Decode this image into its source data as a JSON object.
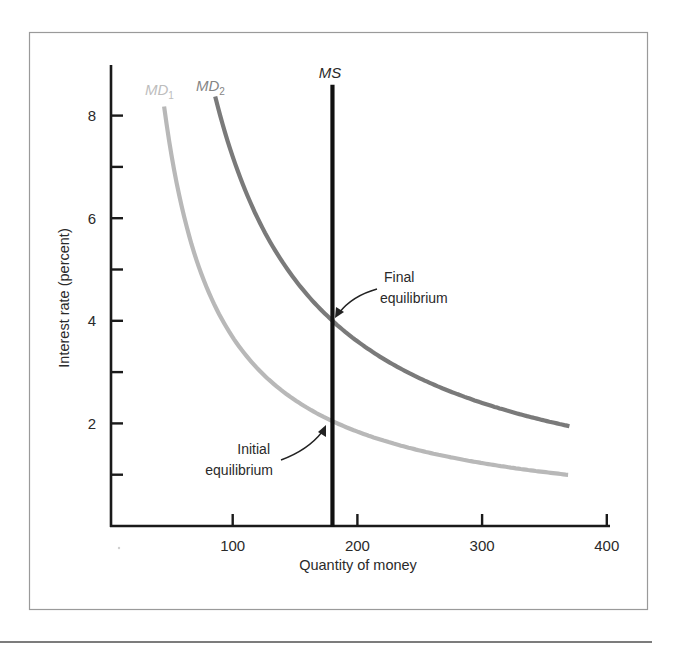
{
  "chart_data": {
    "type": "line",
    "title": "",
    "xlabel": "Quantity of money",
    "ylabel": "Interest rate (percent)",
    "xlim": [
      0,
      400
    ],
    "ylim": [
      0,
      9
    ],
    "x_ticks": [
      100,
      200,
      300,
      400
    ],
    "x_tick_labels": [
      "100",
      "200",
      "300",
      "400"
    ],
    "y_ticks": [
      1,
      2,
      3,
      4,
      5,
      6,
      7,
      8
    ],
    "y_tick_labels": [
      "",
      "2",
      "",
      "4",
      "",
      "6",
      "",
      "8"
    ],
    "grid": false,
    "legend": "inline labels at top of curves",
    "series": [
      {
        "name": "MD1",
        "label_main": "MD",
        "label_sub": "1",
        "color": "#b8b8b8",
        "kind": "money demand curve (r = k/Q)",
        "k": 368,
        "x": [
          45,
          60,
          80,
          100,
          130,
          160,
          180,
          220,
          260,
          300,
          340,
          370
        ],
        "values": [
          8.2,
          6.13,
          4.6,
          3.68,
          2.83,
          2.3,
          2.04,
          1.67,
          1.42,
          1.23,
          1.08,
          0.99
        ]
      },
      {
        "name": "MD2",
        "label_main": "MD",
        "label_sub": "2",
        "color": "#7a7a7a",
        "kind": "money demand curve (r = k/Q)",
        "k": 720,
        "x": [
          86,
          100,
          120,
          150,
          180,
          220,
          260,
          300,
          340,
          370
        ],
        "values": [
          8.37,
          7.2,
          6.0,
          4.8,
          4.0,
          3.27,
          2.77,
          2.4,
          2.12,
          1.95
        ]
      },
      {
        "name": "MS",
        "label_main": "MS",
        "color": "#111111",
        "kind": "vertical money supply",
        "x": [
          180,
          180
        ],
        "values": [
          0,
          8.6
        ]
      }
    ],
    "annotations": [
      {
        "text_lines": [
          "Final",
          "equilibrium"
        ],
        "point": [
          180,
          4.0
        ],
        "arrow": true
      },
      {
        "text_lines": [
          "Initial",
          "equilibrium"
        ],
        "point": [
          180,
          2.05
        ],
        "arrow": true
      }
    ]
  }
}
